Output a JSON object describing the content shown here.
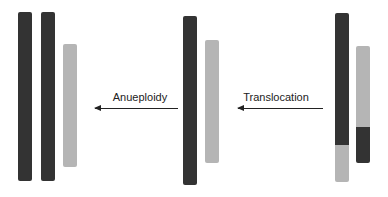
{
  "diagram": {
    "type": "chromosome-rearrangement",
    "colors": {
      "chromosome_a": "#333333",
      "chromosome_b": "#b5b5b5"
    },
    "stages": [
      {
        "name": "after-anueploidy",
        "chromosomes": [
          "dark",
          "dark",
          "light"
        ]
      },
      {
        "name": "normal",
        "chromosomes": [
          "dark",
          "light"
        ]
      },
      {
        "name": "translocated",
        "chromosomes": [
          "dark-with-light-end",
          "light-with-dark-end"
        ]
      }
    ],
    "arrows": [
      {
        "label": "Anueploidy",
        "direction": "left"
      },
      {
        "label": "Translocation",
        "direction": "left"
      }
    ]
  }
}
